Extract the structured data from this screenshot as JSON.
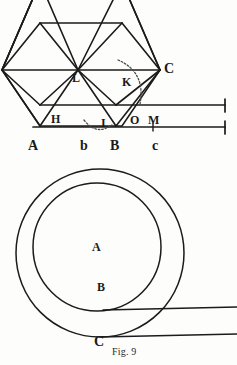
{
  "figure": {
    "caption": "Fig. 9",
    "stroke_color": "#1b1b1b",
    "background_color": "#fdfdfb",
    "dotted_color": "#4a4a4a"
  },
  "top_diagram": {
    "name": "hexagon-rolling-construction",
    "labels": [
      {
        "id": "L",
        "text": "L",
        "x": 72,
        "y": 72,
        "size": "lbl-md"
      },
      {
        "id": "K",
        "text": "K",
        "x": 122,
        "y": 76,
        "size": "lbl-md"
      },
      {
        "id": "C",
        "text": "C",
        "x": 164,
        "y": 62,
        "size": "lbl-lg"
      },
      {
        "id": "H",
        "text": "H",
        "x": 51,
        "y": 113,
        "size": "lbl-md"
      },
      {
        "id": "I",
        "text": "I",
        "x": 101,
        "y": 117,
        "size": "lbl-md"
      },
      {
        "id": "O",
        "text": "O",
        "x": 130,
        "y": 114,
        "size": "lbl-md"
      },
      {
        "id": "M",
        "text": "M",
        "x": 148,
        "y": 114,
        "size": "lbl-md"
      },
      {
        "id": "A",
        "text": "A",
        "x": 28,
        "y": 139,
        "size": "lbl-lg"
      },
      {
        "id": "b",
        "text": "b",
        "x": 80,
        "y": 139,
        "size": "lbl-lg"
      },
      {
        "id": "B",
        "text": "B",
        "x": 110,
        "y": 139,
        "size": "lbl-lg"
      },
      {
        "id": "c",
        "text": "c",
        "x": 152,
        "y": 139,
        "size": "lbl-lg"
      }
    ]
  },
  "bottom_diagram": {
    "name": "concentric-circles-rolling",
    "labels": [
      {
        "id": "A",
        "text": "A",
        "x": 92,
        "y": 241,
        "size": "lbl-md"
      },
      {
        "id": "B",
        "text": "B",
        "x": 97,
        "y": 281,
        "size": "lbl-md"
      },
      {
        "id": "C",
        "text": "C",
        "x": 94,
        "y": 335,
        "size": "lbl-lg"
      }
    ],
    "outer_circle": {
      "cx": 100,
      "cy": 253,
      "r": 84
    },
    "inner_circle": {
      "cx": 97,
      "cy": 247,
      "r": 64
    }
  }
}
